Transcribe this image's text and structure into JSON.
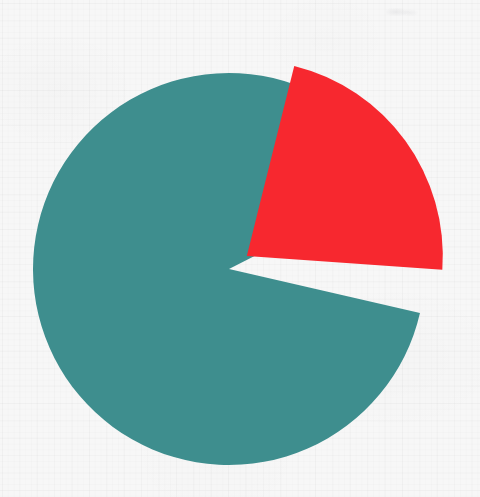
{
  "canvas": {
    "width": 480,
    "height": 497,
    "background_color": "#f7f7f7",
    "grid_visible": true,
    "grid_cell_px": 17.4
  },
  "chart_data": {
    "type": "pie",
    "title": "",
    "subtitle": "",
    "xlabel": "",
    "ylabel": "",
    "legend_position": "none",
    "labels_visible": false,
    "categories": [
      "Slice 1",
      "Slice 2"
    ],
    "values": [
      89,
      11
    ],
    "percentages": [
      "89%",
      "11%"
    ],
    "colors": [
      "#3e8e8e",
      "#f7282f"
    ],
    "slices": [
      {
        "name": "Slice 1",
        "value": 89,
        "percent": "89%",
        "color": "#3e8e8e",
        "start_angle_deg": 103,
        "end_angle_deg": 423,
        "exploded": false,
        "explode_offset_px": 0
      },
      {
        "name": "Slice 2",
        "value": 11,
        "percent": "11%",
        "color": "#f7282f",
        "start_angle_deg": 14,
        "end_angle_deg": 94,
        "exploded": true,
        "explode_offset_px": 22
      }
    ],
    "start_angle_deg": 14,
    "direction": "clockwise",
    "center_x": 229,
    "center_y": 269,
    "radius": 196,
    "gap_color": "#f7f7f7"
  },
  "annotations": {
    "scan_artifact": "smudge"
  }
}
